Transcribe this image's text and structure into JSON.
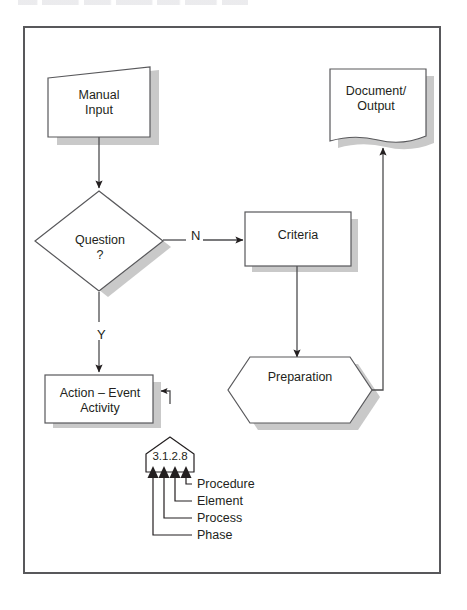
{
  "page": {
    "background_color": "#ffffff",
    "frame_border_color": "#58585b",
    "shadow_color": "#c9c9c9",
    "line_color": "#4d4d4f",
    "text_color": "#231f20"
  },
  "diagram": {
    "nodes": [
      {
        "id": "manual-input",
        "shape": "manual-input",
        "label": "Manual\nInput"
      },
      {
        "id": "question",
        "shape": "decision",
        "label": "Question\n?"
      },
      {
        "id": "action-event",
        "shape": "process",
        "label": "Action – Event\nActivity"
      },
      {
        "id": "criteria",
        "shape": "process",
        "label": "Criteria"
      },
      {
        "id": "preparation",
        "shape": "preparation",
        "label": "Preparation"
      },
      {
        "id": "document",
        "shape": "document",
        "label": "Document/\nOutput"
      }
    ],
    "edges": [
      {
        "from": "manual-input",
        "to": "question",
        "label": ""
      },
      {
        "from": "question",
        "to": "criteria",
        "label": "N"
      },
      {
        "from": "question",
        "to": "action-event",
        "label": "Y"
      },
      {
        "from": "criteria",
        "to": "preparation",
        "label": ""
      },
      {
        "from": "preparation",
        "to": "document",
        "label": ""
      },
      {
        "from": "callout",
        "to": "action-event",
        "label": ""
      }
    ],
    "branch_labels": {
      "no": "N",
      "yes": "Y"
    }
  },
  "callout": {
    "number": "3.1.2.8",
    "segments": [
      "3",
      "1",
      "2",
      "8"
    ],
    "legend": [
      {
        "segment": "8",
        "label": "Procedure"
      },
      {
        "segment": "2",
        "label": "Element"
      },
      {
        "segment": "1",
        "label": "Process"
      },
      {
        "segment": "3",
        "label": "Phase"
      }
    ]
  }
}
